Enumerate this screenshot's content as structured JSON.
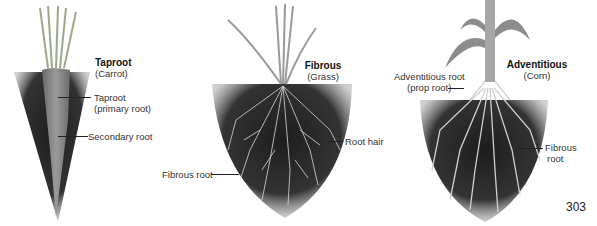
{
  "figure": {
    "page_number": "303",
    "panels": [
      {
        "id": "taproot",
        "title": "Taproot",
        "subtitle": "(Carrot)",
        "labels": [
          {
            "text_line1": "Taproot",
            "text_line2": "(primary root)"
          },
          {
            "text_line1": "Secondary root"
          }
        ]
      },
      {
        "id": "fibrous",
        "title": "Fibrous",
        "subtitle": "(Grass)",
        "labels": [
          {
            "text_line1": "Root hair"
          },
          {
            "text_line1": "Fibrous root"
          }
        ]
      },
      {
        "id": "adventitious",
        "title": "Adventitious",
        "subtitle": "(Corn)",
        "labels": [
          {
            "text_line1": "Adventitious root",
            "text_line2": "(prop root)"
          },
          {
            "text_line1": "Fibrous",
            "text_line2": "root"
          }
        ]
      }
    ]
  }
}
